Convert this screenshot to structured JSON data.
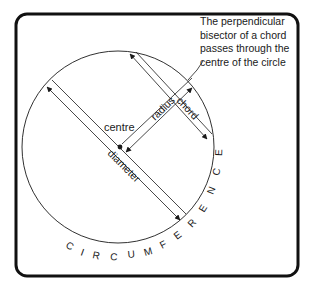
{
  "diagram": {
    "labels": {
      "centre": "centre",
      "radius": "radius",
      "chord": "chord",
      "diameter": "diameter",
      "circumference": "CIRCUMFERENCE"
    },
    "note": {
      "lines": [
        "The perpendicular",
        "bisector of a chord",
        "passes through the",
        "centre of the circle"
      ]
    },
    "colors": {
      "stroke": "#1a1a1a",
      "frame": "#111111",
      "background": "#ffffff"
    }
  }
}
